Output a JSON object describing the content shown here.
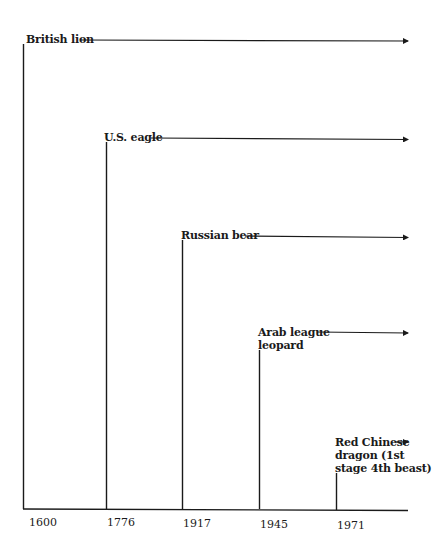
{
  "diagram": {
    "type": "timeline",
    "axis": {
      "ticks": [
        {
          "label": "1600",
          "x": 23
        },
        {
          "label": "1776",
          "x": 106
        },
        {
          "label": "1917",
          "x": 182
        },
        {
          "label": "1945",
          "x": 259
        },
        {
          "label": "1971",
          "x": 336
        }
      ]
    },
    "entities": [
      {
        "label": "British lion",
        "lines": [
          "British lion"
        ],
        "start": "1600"
      },
      {
        "label": "U.S. eagle",
        "lines": [
          "U.S. eagle"
        ],
        "start": "1776"
      },
      {
        "label": "Russian bear",
        "lines": [
          "Russian bear"
        ],
        "start": "1917"
      },
      {
        "label": "Arab league leopard",
        "lines": [
          "Arab league",
          "leopard"
        ],
        "start": "1945"
      },
      {
        "label": "Red Chinese dragon (1st stage 4th beast)",
        "lines": [
          "Red Chinese",
          "dragon (1st",
          "stage 4th beast)"
        ],
        "start": "1971"
      }
    ],
    "colors": {
      "line": "#1a1a1a",
      "background": "#ffffff"
    }
  }
}
